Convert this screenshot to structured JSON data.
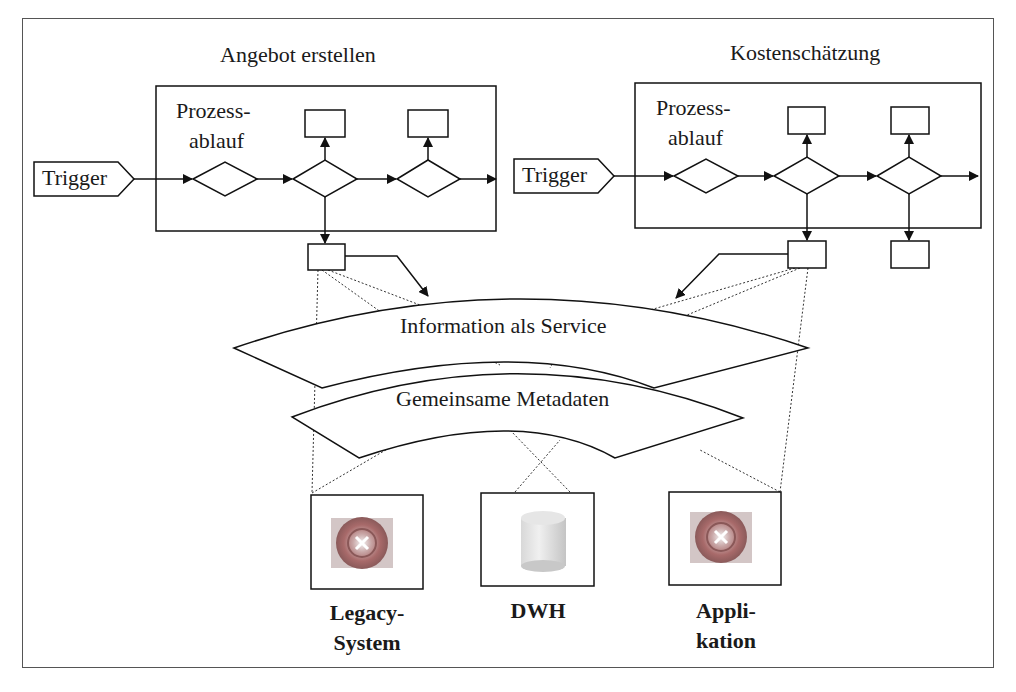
{
  "diagram": {
    "processes": [
      {
        "title": "Angebot erstellen",
        "box_label_line1": "Prozess-",
        "box_label_line2": "ablauf",
        "trigger_label": "Trigger"
      },
      {
        "title": "Kostenschätzung",
        "box_label_line1": "Prozess-",
        "box_label_line2": "ablauf",
        "trigger_label": "Trigger"
      }
    ],
    "layers": {
      "service": "Information als Service",
      "metadata": "Gemeinsame Metadaten"
    },
    "systems": [
      {
        "line1": "Legacy-",
        "line2": "System",
        "icon": "gear-disc-icon"
      },
      {
        "line1": "DWH",
        "line2": "",
        "icon": "database-cylinder-icon"
      },
      {
        "line1": "Appli-",
        "line2": "kation",
        "icon": "gear-disc-icon"
      }
    ]
  }
}
